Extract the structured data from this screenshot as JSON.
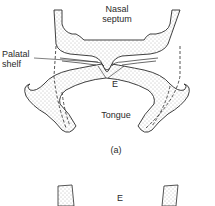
{
  "figure": {
    "panel_a": {
      "labels": {
        "nasal_septum_line1": "Nasal",
        "nasal_septum_line2": "septum",
        "palatal_shelf_line1": "Palatal",
        "palatal_shelf_line2": "shelf",
        "epithelium_marker": "E",
        "tongue": "Tongue"
      },
      "caption": "(a)"
    },
    "panel_b": {
      "labels": {
        "epithelium_marker": "E"
      }
    },
    "colors": {
      "outline": "#2a2a2a",
      "stipple": "#7a7a7a",
      "background": "#ffffff"
    }
  }
}
